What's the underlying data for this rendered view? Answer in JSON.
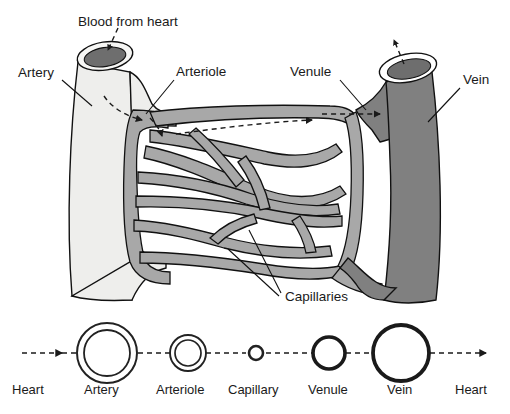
{
  "figure": {
    "background_color": "#ffffff",
    "labels": {
      "blood_from_heart": "Blood from heart",
      "artery": "Artery",
      "arteriole": "Arteriole",
      "venule": "Venule",
      "vein": "Vein",
      "capillaries": "Capillaries"
    },
    "colors": {
      "artery_fill": "#eeeeec",
      "vein_fill": "#808080",
      "capillary_fill": "#a8a8a8",
      "lumen_dark": "#6e6e6e",
      "outline": "#111111",
      "text": "#1a1a1a"
    }
  },
  "legend": {
    "arrow_label_left": "Heart",
    "arrow_label_right": "Heart",
    "items": [
      {
        "label": "Heart",
        "type": "endpoint"
      },
      {
        "label": "Artery",
        "type": "cross-section",
        "outer_radius": 30,
        "wall_thickness": 2.0,
        "wall_color": "#222222",
        "inner_gap": 7
      },
      {
        "label": "Arteriole",
        "type": "cross-section",
        "outer_radius": 18,
        "wall_thickness": 1.8,
        "wall_color": "#222222",
        "inner_gap": 5
      },
      {
        "label": "Capillary",
        "type": "cross-section",
        "outer_radius": 7,
        "wall_thickness": 2.4,
        "wall_color": "#222222",
        "inner_gap": 2
      },
      {
        "label": "Venule",
        "type": "cross-section",
        "outer_radius": 17,
        "wall_thickness": 3.4,
        "wall_color": "#1a1a1a",
        "inner_gap": 0
      },
      {
        "label": "Vein",
        "type": "cross-section",
        "outer_radius": 29,
        "wall_thickness": 3.6,
        "wall_color": "#1a1a1a",
        "inner_gap": 0
      },
      {
        "label": "Heart",
        "type": "endpoint"
      }
    ]
  },
  "flow": {
    "direction": "left-to-right",
    "style": "dashed-with-arrowheads"
  }
}
